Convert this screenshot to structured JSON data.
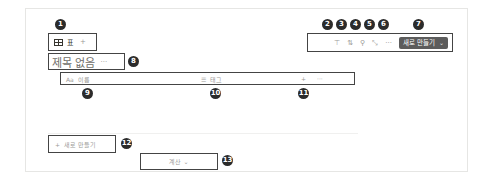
{
  "view_tabs": {
    "table_icon": "table-icon",
    "active_view_label": "표",
    "add_view_label": "+"
  },
  "toolbar": {
    "filter_icon": "filter-icon",
    "filter_glyph": "⊤",
    "sort_icon": "sort-icon",
    "sort_glyph": "⇅",
    "search_icon": "search-icon",
    "search_glyph": "⚲",
    "expand_icon": "expand-icon",
    "expand_glyph": "⤡",
    "more_icon": "more-icon",
    "more_glyph": "···",
    "new_button_label": "새로 만들기",
    "new_button_chevron": "⌄"
  },
  "database": {
    "title": "제목 없음",
    "title_more": "···",
    "columns": [
      {
        "icon": "Aa",
        "label": "이름"
      },
      {
        "icon": "☰",
        "label": "태그"
      }
    ],
    "add_column": "+",
    "column_more": "···",
    "new_row_plus": "+",
    "new_row_label": "새로 만들기",
    "calculate_label": "계산",
    "calculate_chevron": "⌄"
  },
  "callouts": [
    "1",
    "2",
    "3",
    "4",
    "5",
    "6",
    "7",
    "8",
    "9",
    "10",
    "11",
    "12",
    "13"
  ],
  "colors": {
    "button_bg": "#5c5c5c",
    "callout_bg": "#2b2b2b",
    "highlight_border": "#444444",
    "muted_text": "#9b9a97"
  }
}
